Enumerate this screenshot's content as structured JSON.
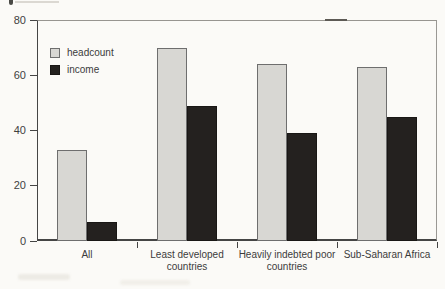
{
  "figure": {
    "background": "#fbfaf7",
    "axis_color": "#454545",
    "frame_rule_color": "#979590"
  },
  "chart_data": {
    "type": "bar",
    "title": "",
    "xlabel": "",
    "ylabel": "",
    "categories": [
      "All",
      "Least developed countries",
      "Heavily indebted poor countries",
      "Sub-Saharan Africa"
    ],
    "series": [
      {
        "name": "headcount",
        "color": "#d8d7d3",
        "border_color": "#6e6e6e",
        "values": [
          33,
          70,
          64,
          63
        ]
      },
      {
        "name": "income",
        "color": "#24211f",
        "border_color": "#191715",
        "values": [
          7,
          49,
          39,
          45
        ]
      }
    ],
    "ylim": [
      0,
      80
    ],
    "yticks": [
      0,
      20,
      40,
      60,
      80
    ],
    "legend_position": "upper-left-inside",
    "grid": false
  }
}
